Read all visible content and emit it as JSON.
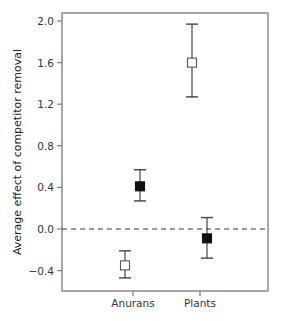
{
  "chart_data": {
    "type": "scatter",
    "title": "",
    "xlabel": "",
    "ylabel": "Average effect of competitor removal",
    "categories": [
      "Anurans",
      "Plants"
    ],
    "ylim": [
      -0.6,
      2.05
    ],
    "yticks": [
      2.0,
      1.6,
      1.2,
      0.8,
      0.4,
      0.0,
      -0.4
    ],
    "ytick_labels": [
      "2.0",
      "1.6",
      "1.2",
      "0.8",
      "0.4",
      "0.0",
      "−0.4"
    ],
    "grid": false,
    "legend": null,
    "reference_line": {
      "y": 0.0,
      "style": "dashed"
    },
    "series": [
      {
        "name": "open",
        "marker": "open-square",
        "values": [
          -0.35,
          1.6
        ],
        "error_low": [
          -0.47,
          1.27
        ],
        "error_high": [
          -0.21,
          1.97
        ]
      },
      {
        "name": "filled",
        "marker": "filled-square",
        "values": [
          0.41,
          -0.09
        ],
        "error_low": [
          0.27,
          -0.28
        ],
        "error_high": [
          0.57,
          0.11
        ]
      }
    ]
  },
  "colors": {
    "axis": "#7a7a7a",
    "marker": "#111111",
    "errorbar": "#444444",
    "dashed": "#333333"
  }
}
